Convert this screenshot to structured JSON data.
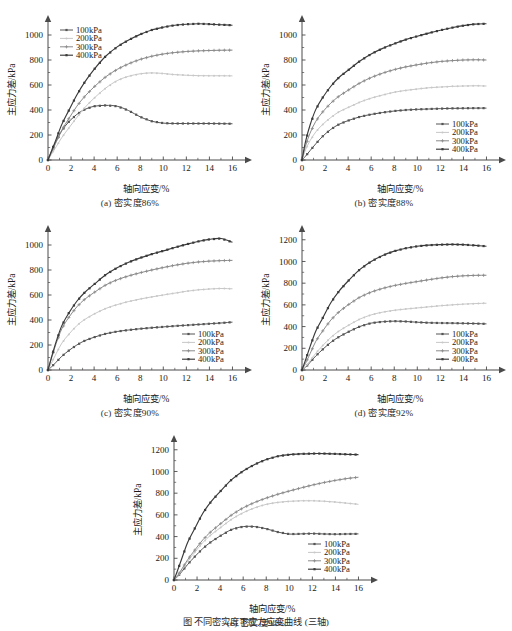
{
  "figure": {
    "bottom_caption": "图    不同密实度下应力应变曲线 (三轴)",
    "background_color": "#ffffff",
    "axis_color": "#4a4a4a",
    "text_color": "#1a1a1a"
  },
  "series_style": {
    "names": [
      "100kPa",
      "200kPa",
      "300kPa",
      "400kPa"
    ],
    "colors": [
      "#555555",
      "#c8c8c8",
      "#8a8a8a",
      "#3a3a3a"
    ]
  },
  "chart_data": [
    {
      "type": "line",
      "panel_label": "(a)",
      "title": "(a)  密实度86%",
      "xlabel": "轴向应变/%",
      "ylabel": "主应力差/kPa",
      "xlim": [
        0,
        17
      ],
      "ylim": [
        0,
        1120
      ],
      "xticks": [
        0,
        2,
        4,
        6,
        8,
        10,
        12,
        14,
        16
      ],
      "yticks": [
        0,
        200,
        400,
        600,
        800,
        1000
      ],
      "grid": false,
      "legend_position": "top-left",
      "x": [
        0,
        0.3,
        0.7,
        1.2,
        1.8,
        2.5,
        3.2,
        4,
        5,
        6,
        7,
        8,
        9,
        10,
        11,
        12,
        13,
        14,
        15,
        16
      ],
      "series": [
        {
          "name": "100kPa",
          "values": [
            0,
            70,
            150,
            235,
            305,
            365,
            405,
            430,
            437,
            430,
            395,
            345,
            310,
            295,
            292,
            292,
            292,
            292,
            291,
            290
          ]
        },
        {
          "name": "200kPa",
          "values": [
            0,
            45,
            105,
            180,
            255,
            340,
            420,
            495,
            575,
            635,
            670,
            690,
            697,
            692,
            683,
            678,
            675,
            674,
            674,
            673
          ]
        },
        {
          "name": "300kPa",
          "values": [
            0,
            60,
            140,
            240,
            330,
            430,
            510,
            585,
            665,
            725,
            770,
            805,
            830,
            848,
            860,
            868,
            873,
            876,
            878,
            879
          ]
        },
        {
          "name": "400kPa",
          "values": [
            0,
            70,
            165,
            285,
            395,
            520,
            625,
            725,
            830,
            905,
            960,
            1005,
            1040,
            1062,
            1078,
            1086,
            1090,
            1087,
            1082,
            1078
          ]
        }
      ]
    },
    {
      "type": "line",
      "panel_label": "(b)",
      "title": "(b)  密实度88%",
      "xlabel": "轴向应变/%",
      "ylabel": "主应力差/kPa",
      "xlim": [
        0,
        17
      ],
      "ylim": [
        0,
        1120
      ],
      "xticks": [
        0,
        2,
        4,
        6,
        8,
        10,
        12,
        14,
        16
      ],
      "yticks": [
        0,
        200,
        400,
        600,
        800,
        1000
      ],
      "grid": false,
      "legend_position": "bottom-right",
      "x": [
        0,
        0.3,
        0.7,
        1.2,
        1.8,
        2.5,
        3.2,
        4,
        5,
        6,
        7,
        8,
        9,
        10,
        11,
        12,
        13,
        14,
        15,
        16
      ],
      "series": [
        {
          "name": "100kPa",
          "values": [
            0,
            30,
            75,
            130,
            190,
            245,
            285,
            315,
            345,
            365,
            380,
            392,
            400,
            405,
            408,
            411,
            413,
            414,
            415,
            415
          ]
        },
        {
          "name": "200kPa",
          "values": [
            0,
            80,
            155,
            225,
            285,
            340,
            385,
            420,
            462,
            495,
            520,
            542,
            557,
            568,
            578,
            584,
            589,
            592,
            594,
            592
          ]
        },
        {
          "name": "300kPa",
          "values": [
            0,
            110,
            215,
            310,
            385,
            455,
            510,
            558,
            615,
            660,
            695,
            723,
            745,
            762,
            777,
            788,
            795,
            800,
            802,
            800
          ]
        },
        {
          "name": "400kPa",
          "values": [
            0,
            145,
            280,
            405,
            500,
            590,
            660,
            718,
            790,
            848,
            893,
            930,
            963,
            990,
            1015,
            1038,
            1058,
            1075,
            1087,
            1090
          ]
        }
      ]
    },
    {
      "type": "line",
      "panel_label": "(c)",
      "title": "(c)  密实度90%",
      "xlabel": "轴向应变/%",
      "ylabel": "主应力差/kPa",
      "xlim": [
        0,
        17
      ],
      "ylim": [
        0,
        1120
      ],
      "xticks": [
        0,
        2,
        4,
        6,
        8,
        10,
        12,
        14,
        16
      ],
      "yticks": [
        0,
        200,
        400,
        600,
        800,
        1000
      ],
      "grid": false,
      "legend_position": "bottom-right",
      "x": [
        0,
        0.3,
        0.7,
        1.2,
        1.8,
        2.5,
        3.2,
        4,
        5,
        6,
        7,
        8,
        9,
        10,
        11,
        12,
        13,
        14,
        15,
        16
      ],
      "series": [
        {
          "name": "100kPa",
          "values": [
            0,
            25,
            62,
            110,
            155,
            200,
            235,
            262,
            290,
            308,
            320,
            330,
            338,
            345,
            352,
            358,
            364,
            370,
            376,
            383
          ]
        },
        {
          "name": "200kPa",
          "values": [
            0,
            55,
            130,
            215,
            285,
            355,
            405,
            448,
            492,
            523,
            548,
            568,
            585,
            600,
            615,
            630,
            641,
            648,
            652,
            650
          ]
        },
        {
          "name": "300kPa",
          "values": [
            0,
            95,
            210,
            330,
            420,
            505,
            567,
            620,
            680,
            722,
            753,
            778,
            800,
            820,
            838,
            853,
            864,
            871,
            875,
            877
          ]
        },
        {
          "name": "400kPa",
          "values": [
            0,
            100,
            225,
            355,
            455,
            550,
            622,
            685,
            762,
            818,
            862,
            897,
            927,
            953,
            980,
            1005,
            1028,
            1045,
            1052,
            1022
          ]
        }
      ]
    },
    {
      "type": "line",
      "panel_label": "(d)",
      "title": "(d)  密实度92%",
      "xlabel": "轴向应变/%",
      "ylabel": "主应力差/kPa",
      "xlim": [
        0,
        17
      ],
      "ylim": [
        0,
        1290
      ],
      "xticks": [
        0,
        2,
        4,
        6,
        8,
        10,
        12,
        14,
        16
      ],
      "yticks": [
        0,
        200,
        400,
        600,
        800,
        1000,
        1200
      ],
      "grid": false,
      "legend_position": "bottom-right",
      "x": [
        0,
        0.3,
        0.7,
        1.2,
        1.8,
        2.5,
        3.2,
        4,
        5,
        6,
        7,
        8,
        9,
        10,
        11,
        12,
        13,
        14,
        15,
        16
      ],
      "series": [
        {
          "name": "100kPa",
          "values": [
            0,
            25,
            70,
            130,
            190,
            255,
            305,
            350,
            400,
            432,
            445,
            450,
            447,
            440,
            435,
            433,
            432,
            430,
            428,
            425
          ]
        },
        {
          "name": "200kPa",
          "values": [
            0,
            30,
            85,
            155,
            225,
            300,
            358,
            410,
            468,
            508,
            533,
            550,
            562,
            572,
            582,
            592,
            600,
            607,
            612,
            615
          ]
        },
        {
          "name": "300kPa",
          "values": [
            0,
            60,
            150,
            265,
            360,
            460,
            535,
            600,
            670,
            718,
            752,
            778,
            798,
            815,
            832,
            848,
            860,
            868,
            872,
            873
          ]
        },
        {
          "name": "400kPa",
          "values": [
            0,
            90,
            215,
            360,
            480,
            620,
            725,
            820,
            925,
            1000,
            1055,
            1095,
            1122,
            1140,
            1150,
            1155,
            1157,
            1155,
            1148,
            1140
          ]
        }
      ]
    },
    {
      "type": "line",
      "panel_label": "(e)",
      "title": "(e)  密实度94%",
      "xlabel": "轴向应变/%",
      "ylabel": "主应力差/kPa",
      "xlim": [
        0,
        17
      ],
      "ylim": [
        0,
        1290
      ],
      "xticks": [
        0,
        2,
        4,
        6,
        8,
        10,
        12,
        14,
        16
      ],
      "yticks": [
        0,
        200,
        400,
        600,
        800,
        1000,
        1200
      ],
      "grid": false,
      "legend_position": "bottom-right",
      "x": [
        0,
        0.3,
        0.7,
        1.2,
        1.8,
        2.5,
        3.2,
        4,
        5,
        6,
        7,
        8,
        9,
        10,
        11,
        12,
        13,
        14,
        15,
        16
      ],
      "series": [
        {
          "name": "100kPa",
          "values": [
            0,
            30,
            80,
            145,
            215,
            290,
            350,
            405,
            465,
            492,
            492,
            472,
            442,
            423,
            425,
            428,
            424,
            422,
            424,
            425
          ]
        },
        {
          "name": "200kPa",
          "values": [
            0,
            35,
            95,
            175,
            255,
            345,
            415,
            480,
            560,
            620,
            665,
            697,
            715,
            725,
            730,
            730,
            726,
            718,
            708,
            697
          ]
        },
        {
          "name": "300kPa",
          "values": [
            0,
            40,
            105,
            190,
            275,
            370,
            445,
            515,
            600,
            665,
            715,
            755,
            790,
            820,
            848,
            875,
            898,
            918,
            935,
            947
          ]
        },
        {
          "name": "400kPa",
          "values": [
            0,
            85,
            205,
            350,
            475,
            615,
            720,
            815,
            925,
            1005,
            1065,
            1110,
            1140,
            1155,
            1162,
            1165,
            1165,
            1162,
            1158,
            1155
          ]
        }
      ]
    }
  ]
}
